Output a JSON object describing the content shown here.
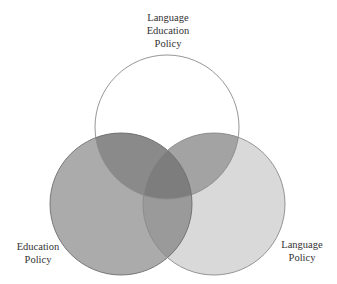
{
  "diagram": {
    "type": "venn",
    "sets": [
      {
        "id": "top",
        "label_lines": [
          "Language",
          "Education",
          "Policy"
        ],
        "fill": "#ffffff",
        "stroke": "#8a8a8a"
      },
      {
        "id": "left",
        "label_lines": [
          "Education",
          "Policy"
        ],
        "fill": "#a9a9a9",
        "stroke": "#7a7a7a"
      },
      {
        "id": "right",
        "label_lines": [
          "Language",
          "Policy"
        ],
        "fill": "#d6d6d6",
        "stroke": "#8a8a8a"
      }
    ],
    "colors": {
      "top_left_overlap": "#858585",
      "top_right_overlap": "#9a9a9a",
      "left_right_overlap": "#959595",
      "center_overlap": "#7a7a7a"
    }
  }
}
